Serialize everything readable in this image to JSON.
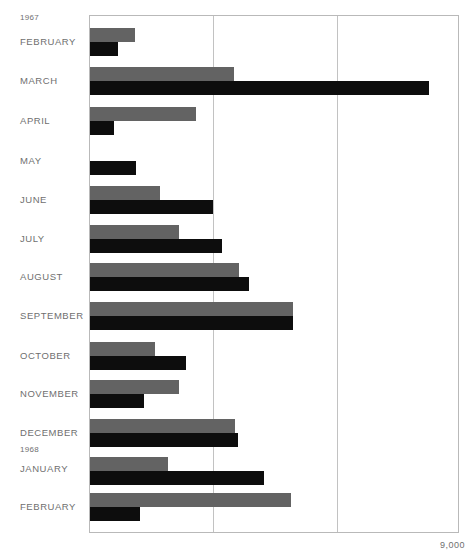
{
  "axis": {
    "max_label": "9,000",
    "max_value": 9000,
    "min_value": 0,
    "gridline_values": [
      3000,
      6000
    ]
  },
  "year_markers": [
    {
      "label": "1967",
      "top": 13
    },
    {
      "label": "1968",
      "top": 445
    }
  ],
  "colors": {
    "gray_series": "#636363",
    "black_series": "#0d0d0d",
    "frame": "#b9b9b9",
    "gridline": "#c2c2c2",
    "text": "#6f6f6f",
    "background": "#ffffff"
  },
  "chart_data": {
    "type": "bar",
    "orientation": "horizontal",
    "title": "",
    "subtitle": "",
    "xlabel": "",
    "ylabel": "",
    "xlim": [
      0,
      9000
    ],
    "ylim": null,
    "grid": true,
    "gridlines_x": [
      3000,
      6000
    ],
    "xticks": [
      9000
    ],
    "xticklabels": [
      "9,000"
    ],
    "legend": [],
    "legend_position": "none",
    "categories": [
      "FEBRUARY",
      "MARCH",
      "APRIL",
      "MAY",
      "JUNE",
      "JULY",
      "AUGUST",
      "SEPTEMBER",
      "OCTOBER",
      "NOVEMBER",
      "DECEMBER",
      "JANUARY",
      "FEBRUARY"
    ],
    "category_years": [
      "1967",
      "1967",
      "1967",
      "1967",
      "1967",
      "1967",
      "1967",
      "1967",
      "1967",
      "1967",
      "1967",
      "1968",
      "1968"
    ],
    "series": [
      {
        "name": "gray",
        "color": "#636363",
        "values": [
          1090,
          3500,
          2580,
          0,
          1700,
          2160,
          3620,
          4930,
          1580,
          2160,
          3530,
          1900,
          4890
        ]
      },
      {
        "name": "black",
        "color": "#0d0d0d",
        "values": [
          680,
          8240,
          580,
          1120,
          2990,
          3210,
          3860,
          4930,
          2330,
          1310,
          3600,
          4230,
          1220
        ]
      }
    ]
  },
  "rows": [
    {
      "month": "FEBRUARY",
      "label_top": 36,
      "bar_top": 27,
      "gray": 1090,
      "black": 680
    },
    {
      "month": "MARCH",
      "label_top": 75,
      "bar_top": 66,
      "gray": 3500,
      "black": 8240
    },
    {
      "month": "APRIL",
      "label_top": 115,
      "bar_top": 106,
      "gray": 2580,
      "black": 580
    },
    {
      "month": "MAY",
      "label_top": 155,
      "bar_top": 146,
      "gray": 0,
      "black": 1120
    },
    {
      "month": "JUNE",
      "label_top": 194,
      "bar_top": 185,
      "gray": 1700,
      "black": 2990
    },
    {
      "month": "JULY",
      "label_top": 233,
      "bar_top": 224,
      "gray": 2160,
      "black": 3210
    },
    {
      "month": "AUGUST",
      "label_top": 271,
      "bar_top": 262,
      "gray": 3620,
      "black": 3860
    },
    {
      "month": "SEPTEMBER",
      "label_top": 310,
      "bar_top": 301,
      "gray": 4930,
      "black": 4930
    },
    {
      "month": "OCTOBER",
      "label_top": 350,
      "bar_top": 341,
      "gray": 1580,
      "black": 2330
    },
    {
      "month": "NOVEMBER",
      "label_top": 388,
      "bar_top": 379,
      "gray": 2160,
      "black": 1310
    },
    {
      "month": "DECEMBER",
      "label_top": 427,
      "bar_top": 418,
      "gray": 3530,
      "black": 3600
    },
    {
      "month": "JANUARY",
      "label_top": 463,
      "bar_top": 456,
      "gray": 1900,
      "black": 4230
    },
    {
      "month": "FEBRUARY",
      "label_top": 501,
      "bar_top": 492,
      "gray": 4890,
      "black": 1220
    }
  ]
}
